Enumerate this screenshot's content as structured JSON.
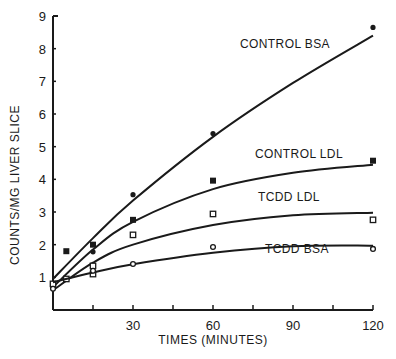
{
  "chart_data": {
    "type": "line",
    "title": "",
    "xlabel": "TIMES (MINUTES)",
    "ylabel": "COUNTS/MG LIVER SLICE",
    "xlim": [
      0,
      120
    ],
    "ylim": [
      0,
      9
    ],
    "x_ticks": [
      15,
      30,
      45,
      60,
      75,
      90,
      105,
      120
    ],
    "x_tick_labels": [
      "",
      "30",
      "",
      "60",
      "",
      "90",
      "",
      "120"
    ],
    "y_ticks": [
      1,
      2,
      3,
      4,
      5,
      6,
      7,
      8,
      9
    ],
    "y_tick_labels": [
      "1",
      "2",
      "3",
      "4",
      "5",
      "6",
      "7",
      "8",
      "9"
    ],
    "grid": false,
    "legend_position": "inline labels near curve ends",
    "series": [
      {
        "name": "CONTROL BSA",
        "marker": "filled-circle",
        "label_pos": [
          240,
          48
        ],
        "points": [
          [
            0,
            0.7
          ],
          [
            15,
            1.78
          ],
          [
            30,
            3.53
          ],
          [
            60,
            5.4
          ],
          [
            120,
            8.65
          ]
        ],
        "curve": [
          [
            0,
            0.95
          ],
          [
            15,
            2.2
          ],
          [
            30,
            3.35
          ],
          [
            60,
            5.3
          ],
          [
            90,
            6.95
          ],
          [
            120,
            8.4
          ]
        ]
      },
      {
        "name": "CONTROL LDL",
        "marker": "filled-square",
        "label_pos": [
          255,
          158
        ],
        "points": [
          [
            0,
            0.75
          ],
          [
            5,
            1.8
          ],
          [
            15,
            2.0
          ],
          [
            30,
            2.76
          ],
          [
            60,
            3.96
          ],
          [
            120,
            4.57
          ]
        ],
        "curve": [
          [
            0,
            0.7
          ],
          [
            15,
            1.85
          ],
          [
            30,
            2.7
          ],
          [
            60,
            3.7
          ],
          [
            90,
            4.2
          ],
          [
            120,
            4.45
          ]
        ]
      },
      {
        "name": "TCDD LDL",
        "marker": "open-square",
        "label_pos": [
          258,
          201
        ],
        "points": [
          [
            0,
            0.8
          ],
          [
            5,
            0.95
          ],
          [
            15,
            1.35
          ],
          [
            15,
            1.1
          ],
          [
            30,
            2.3
          ],
          [
            60,
            2.94
          ],
          [
            120,
            2.76
          ]
        ],
        "curve": [
          [
            0,
            0.6
          ],
          [
            15,
            1.45
          ],
          [
            30,
            2.0
          ],
          [
            60,
            2.6
          ],
          [
            90,
            2.9
          ],
          [
            120,
            2.98
          ]
        ]
      },
      {
        "name": "TCDD BSA",
        "marker": "open-circle",
        "label_pos": [
          265,
          253
        ],
        "points": [
          [
            0,
            0.65
          ],
          [
            15,
            1.2
          ],
          [
            30,
            1.41
          ],
          [
            60,
            1.93
          ],
          [
            120,
            1.87
          ]
        ],
        "curve": [
          [
            0,
            0.85
          ],
          [
            15,
            1.15
          ],
          [
            30,
            1.4
          ],
          [
            60,
            1.75
          ],
          [
            90,
            1.95
          ],
          [
            120,
            1.97
          ]
        ]
      }
    ]
  }
}
